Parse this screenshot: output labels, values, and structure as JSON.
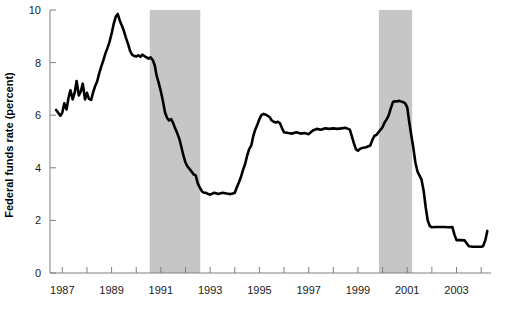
{
  "chart_data": {
    "type": "line",
    "title": "",
    "subtitle": "",
    "xlabel": "",
    "ylabel": "Federal funds rate (percent)",
    "xlim": [
      1986.5,
      2004.4
    ],
    "ylim": [
      0,
      10
    ],
    "grid": false,
    "legend": null,
    "legend_position": "none",
    "line_color": "#000000",
    "line_width": 2.6,
    "axis_color": "#808080",
    "background_color": "#ffffff",
    "y_ticks": [
      0,
      2,
      4,
      6,
      8,
      10
    ],
    "y_tick_labels": [
      "0",
      "2",
      "4",
      "6",
      "8",
      "10"
    ],
    "x_ticks": [
      1987,
      1988,
      1989,
      1990,
      1991,
      1992,
      1993,
      1994,
      1995,
      1996,
      1997,
      1998,
      1999,
      2000,
      2001,
      2002,
      2003,
      2004
    ],
    "x_tick_labels": [
      "1987",
      "",
      "1989",
      "",
      "1991",
      "",
      "1993",
      "",
      "1995",
      "",
      "1997",
      "",
      "1999",
      "",
      "2001",
      "",
      "2003",
      ""
    ],
    "x_labeled_ticks": [
      {
        "x": 1987,
        "label": "1987"
      },
      {
        "x": 1989,
        "label": "1989"
      },
      {
        "x": 1991,
        "label": "1991"
      },
      {
        "x": 1993,
        "label": "1993"
      },
      {
        "x": 1995,
        "label": "1995"
      },
      {
        "x": 1997,
        "label": "1997"
      },
      {
        "x": 1999,
        "label": "1999"
      },
      {
        "x": 2001,
        "label": "2001"
      },
      {
        "x": 2003,
        "label": "2003"
      }
    ],
    "shaded_regions": [
      {
        "name": "recession-1990-1991",
        "x_start": 1990.55,
        "x_end": 1992.6,
        "color": "#c6c6c6"
      },
      {
        "name": "recession-2001",
        "x_start": 1999.85,
        "x_end": 2001.2,
        "color": "#c6c6c6"
      }
    ],
    "series": [
      {
        "name": "Federal funds rate",
        "color": "#000000",
        "x": [
          1986.75,
          1986.92,
          1987.0,
          1987.08,
          1987.17,
          1987.25,
          1987.33,
          1987.42,
          1987.5,
          1987.58,
          1987.67,
          1987.75,
          1987.83,
          1987.92,
          1988.0,
          1988.08,
          1988.17,
          1988.25,
          1988.33,
          1988.42,
          1988.5,
          1988.58,
          1988.67,
          1988.75,
          1988.83,
          1988.92,
          1989.0,
          1989.08,
          1989.17,
          1989.25,
          1989.33,
          1989.42,
          1989.5,
          1989.58,
          1989.67,
          1989.75,
          1989.83,
          1989.92,
          1990.0,
          1990.08,
          1990.17,
          1990.25,
          1990.33,
          1990.42,
          1990.5,
          1990.58,
          1990.67,
          1990.75,
          1990.83,
          1990.92,
          1991.0,
          1991.08,
          1991.17,
          1991.25,
          1991.33,
          1991.42,
          1991.5,
          1991.58,
          1991.67,
          1991.75,
          1991.83,
          1991.92,
          1992.0,
          1992.08,
          1992.17,
          1992.25,
          1992.33,
          1992.42,
          1992.5,
          1992.58,
          1992.67,
          1992.75,
          1992.83,
          1992.92,
          1993.0,
          1993.17,
          1993.33,
          1993.5,
          1993.67,
          1993.83,
          1993.92,
          1994.0,
          1994.08,
          1994.17,
          1994.25,
          1994.33,
          1994.42,
          1994.5,
          1994.58,
          1994.67,
          1994.75,
          1994.83,
          1994.92,
          1995.0,
          1995.08,
          1995.17,
          1995.25,
          1995.33,
          1995.42,
          1995.5,
          1995.58,
          1995.67,
          1995.75,
          1995.83,
          1995.92,
          1996.0,
          1996.17,
          1996.33,
          1996.5,
          1996.67,
          1996.83,
          1997.0,
          1997.17,
          1997.33,
          1997.5,
          1997.67,
          1997.83,
          1998.0,
          1998.17,
          1998.33,
          1998.5,
          1998.67,
          1998.75,
          1998.83,
          1998.92,
          1999.0,
          1999.08,
          1999.17,
          1999.33,
          1999.5,
          1999.58,
          1999.67,
          1999.75,
          1999.83,
          1999.92,
          2000.0,
          2000.08,
          2000.17,
          2000.25,
          2000.33,
          2000.42,
          2000.5,
          2000.58,
          2000.67,
          2000.75,
          2000.83,
          2000.92,
          2001.0,
          2001.08,
          2001.17,
          2001.25,
          2001.33,
          2001.42,
          2001.5,
          2001.58,
          2001.67,
          2001.75,
          2001.83,
          2001.92,
          2002.0,
          2002.17,
          2002.33,
          2002.5,
          2002.67,
          2002.83,
          2002.92,
          2003.0,
          2003.17,
          2003.33,
          2003.5,
          2003.67,
          2003.83,
          2004.0,
          2004.08,
          2004.17,
          2004.25
        ],
        "y": [
          6.2,
          5.98,
          6.1,
          6.45,
          6.22,
          6.65,
          6.95,
          6.6,
          6.85,
          7.3,
          6.75,
          6.9,
          7.2,
          6.6,
          6.85,
          6.62,
          6.58,
          6.87,
          7.1,
          7.3,
          7.6,
          7.85,
          8.1,
          8.35,
          8.55,
          8.8,
          9.1,
          9.45,
          9.75,
          9.85,
          9.6,
          9.4,
          9.2,
          8.95,
          8.7,
          8.45,
          8.3,
          8.25,
          8.23,
          8.28,
          8.22,
          8.3,
          8.25,
          8.2,
          8.15,
          8.2,
          8.1,
          7.9,
          7.5,
          7.2,
          6.9,
          6.55,
          6.1,
          5.9,
          5.8,
          5.85,
          5.7,
          5.5,
          5.3,
          5.1,
          4.8,
          4.45,
          4.2,
          4.05,
          3.95,
          3.85,
          3.75,
          3.7,
          3.4,
          3.25,
          3.1,
          3.05,
          3.05,
          3.0,
          2.98,
          3.05,
          3.0,
          3.05,
          3.02,
          3.0,
          3.02,
          3.05,
          3.25,
          3.45,
          3.65,
          3.9,
          4.15,
          4.45,
          4.7,
          4.85,
          5.2,
          5.45,
          5.65,
          5.85,
          6.0,
          6.05,
          6.02,
          5.98,
          5.92,
          5.8,
          5.75,
          5.72,
          5.75,
          5.7,
          5.5,
          5.35,
          5.32,
          5.3,
          5.35,
          5.3,
          5.32,
          5.28,
          5.42,
          5.48,
          5.45,
          5.5,
          5.48,
          5.5,
          5.48,
          5.5,
          5.52,
          5.45,
          5.2,
          4.95,
          4.7,
          4.65,
          4.72,
          4.75,
          4.78,
          4.85,
          5.05,
          5.22,
          5.25,
          5.35,
          5.45,
          5.55,
          5.72,
          5.85,
          6.0,
          6.25,
          6.5,
          6.53,
          6.52,
          6.55,
          6.52,
          6.5,
          6.45,
          6.3,
          5.75,
          5.2,
          4.75,
          4.2,
          3.85,
          3.7,
          3.55,
          3.1,
          2.5,
          2.0,
          1.78,
          1.74,
          1.75,
          1.75,
          1.75,
          1.74,
          1.75,
          1.45,
          1.25,
          1.25,
          1.24,
          1.02,
          1.0,
          1.0,
          1.0,
          1.02,
          1.25,
          1.6
        ]
      }
    ]
  },
  "axis": {
    "y_label": "Federal funds rate (percent)"
  }
}
